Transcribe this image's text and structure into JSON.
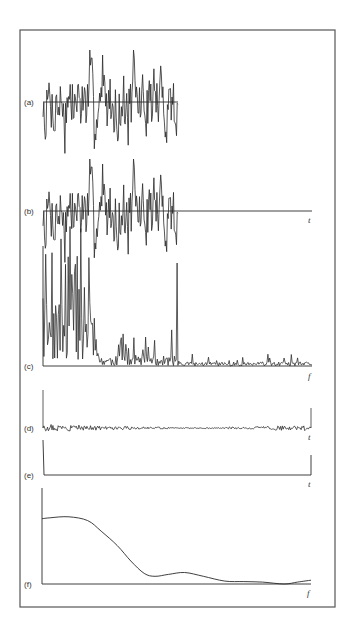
{
  "colors": {
    "ink": "#2a2a2a",
    "frame": "#555555",
    "background": "#ffffff"
  },
  "chart_data": [
    {
      "panel": "a",
      "type": "line",
      "label": "(a)",
      "description": "random noise signal segment with horizontal zero line",
      "xlabel": "",
      "x_range_px": [
        43,
        178
      ],
      "baseline_px": 102,
      "amplitude_px": 52,
      "seed": 7,
      "n_points": 180,
      "grid": false
    },
    {
      "panel": "b",
      "type": "line",
      "label": "(b)",
      "description": "same noise segment followed by zero-padding along t axis",
      "xlabel": "t",
      "x_range_px": [
        43,
        178
      ],
      "axis_end_px": 312,
      "baseline_px": 211,
      "amplitude_px": 52,
      "seed": 7,
      "n_points": 180,
      "grid": false
    },
    {
      "panel": "c",
      "type": "line",
      "label": "(c)",
      "description": "power spectrum (periodogram) — large spikes at low f then small noise floor",
      "xlabel": "f",
      "x_range_px": [
        43,
        312
      ],
      "baseline_px": 366,
      "seed": 11,
      "n_points": 300,
      "grid": false
    },
    {
      "panel": "d",
      "type": "line",
      "label": "(d)",
      "description": "autocorrelation — spike at zero lag, small fluctuations, spike at end",
      "xlabel": "t",
      "x_range_px": [
        43,
        311
      ],
      "baseline_px": 428,
      "spike_left_top_px": 390,
      "spike_right_top_px": 408,
      "seed": 3,
      "n_points": 300,
      "grid": false
    },
    {
      "panel": "e",
      "type": "line",
      "label": "(e)",
      "description": "idealized autocorrelation — spike at zero lag and at end, flat otherwise",
      "xlabel": "t",
      "x_range_px": [
        43,
        311
      ],
      "baseline_px": 475,
      "spike_left_top_px": 440,
      "spike_right_top_px": 455,
      "grid": false
    },
    {
      "panel": "f",
      "type": "line",
      "label": "(f)",
      "description": "smoothed spectral estimate",
      "xlabel": "f",
      "x_range_px": [
        42,
        311
      ],
      "baseline_px": 584,
      "yaxis_top_px": 488,
      "x_norm": [
        0,
        0.03,
        0.1,
        0.17,
        0.22,
        0.28,
        0.33,
        0.38,
        0.42,
        0.47,
        0.53,
        0.6,
        0.68,
        0.75,
        0.82,
        0.9,
        0.95,
        1.0
      ],
      "y_norm": [
        0.68,
        0.69,
        0.7,
        0.66,
        0.55,
        0.4,
        0.24,
        0.11,
        0.08,
        0.1,
        0.12,
        0.08,
        0.03,
        0.025,
        0.02,
        0.0,
        0.02,
        0.04
      ],
      "grid": false
    }
  ]
}
